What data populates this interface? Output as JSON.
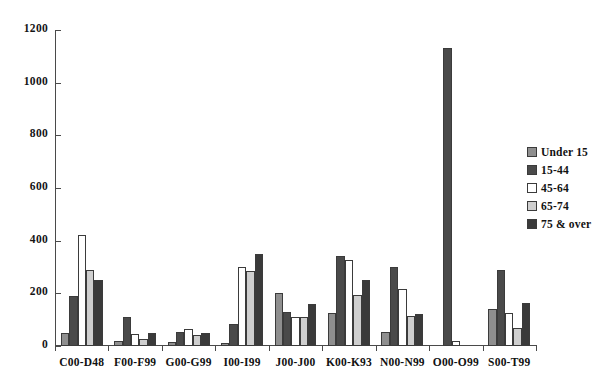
{
  "chart_data": {
    "type": "bar",
    "title": "",
    "subtitle": "",
    "xlabel": "",
    "ylabel": "",
    "grid": false,
    "legend_position": "right",
    "ylim": [
      0,
      1200
    ],
    "yticks": [
      0,
      200,
      400,
      600,
      800,
      1000,
      1200
    ],
    "ytick_labels": [
      "0",
      "200",
      "400",
      "600",
      "800",
      "1000",
      "1200"
    ],
    "categories": [
      "C00-D48",
      "F00-F99",
      "G00-G99",
      "I00-I99",
      "J00-J00",
      "K00-K93",
      "N00-N99",
      "O00-O99",
      "S00-T99"
    ],
    "series": [
      {
        "name": "Under 15",
        "color": "#8f8f8f",
        "values": [
          50,
          20,
          15,
          10,
          200,
          125,
          55,
          0,
          140
        ]
      },
      {
        "name": "15-44",
        "color": "#4a4a4a",
        "values": [
          190,
          110,
          55,
          85,
          130,
          340,
          300,
          1130,
          290
        ]
      },
      {
        "name": "45-64",
        "color": "#ffffff",
        "values": [
          420,
          45,
          65,
          300,
          110,
          325,
          215,
          20,
          125
        ]
      },
      {
        "name": "65-74",
        "color": "#cfcfcf",
        "values": [
          290,
          25,
          40,
          285,
          110,
          195,
          115,
          0,
          70
        ]
      },
      {
        "name": "75 & over",
        "color": "#3a3a3a",
        "values": [
          250,
          50,
          50,
          350,
          160,
          250,
          120,
          0,
          165
        ]
      }
    ]
  },
  "legend": {
    "items": [
      {
        "label": "Under 15",
        "color": "#8f8f8f"
      },
      {
        "label": "15-44",
        "color": "#4a4a4a"
      },
      {
        "label": "45-64",
        "color": "#ffffff"
      },
      {
        "label": "65-74",
        "color": "#cfcfcf"
      },
      {
        "label": "75 & over",
        "color": "#3a3a3a"
      }
    ]
  }
}
